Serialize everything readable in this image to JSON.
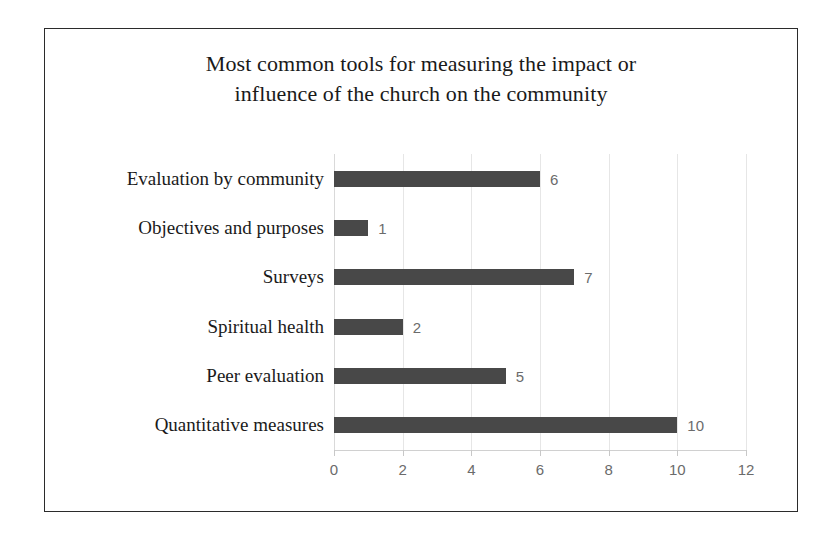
{
  "chart_data": {
    "type": "bar",
    "orientation": "horizontal",
    "title": "Most common tools for measuring the impact or influence of the church on the community",
    "title_lines": [
      "Most common tools for measuring the impact or",
      "influence of the church on the community"
    ],
    "xlabel": "",
    "ylabel": "",
    "categories": [
      "Evaluation by community",
      "Objectives and purposes",
      "Surveys",
      "Spiritual health",
      "Peer evaluation",
      "Quantitative measures"
    ],
    "values": [
      6,
      1,
      7,
      2,
      5,
      10
    ],
    "value_labels": [
      "6",
      "1",
      "7",
      "2",
      "5",
      "10"
    ],
    "xlim": [
      0,
      12
    ],
    "xticks": [
      0,
      2,
      4,
      6,
      8,
      10,
      12
    ],
    "xtick_labels": [
      "0",
      "2",
      "4",
      "6",
      "8",
      "10",
      "12"
    ],
    "grid": true,
    "grid_axis": "x",
    "legend": false,
    "colors": {
      "bar": "#484848",
      "gridline": "#e6e6e6",
      "axis_line": "#d0d0d0",
      "tick_label": "#6b6b6b",
      "value_label": "#6b6b6b",
      "category_label": "#1a1a1a",
      "title": "#1a1a1a",
      "frame_border": "#2b2b2b",
      "background": "#ffffff"
    }
  }
}
